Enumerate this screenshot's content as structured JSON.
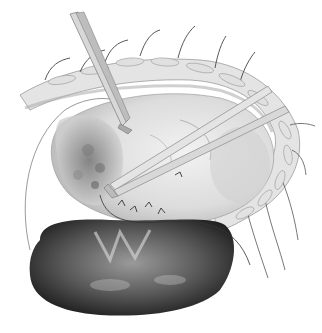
{
  "illustration": {
    "subject": "surgical illustration",
    "style": "grayscale pencil drawing",
    "background": "#ffffff",
    "elements": [
      {
        "name": "incision-cavity",
        "shade": "#d8d8d8"
      },
      {
        "name": "retracted-wound-edge",
        "shade": "#c4c4c4"
      },
      {
        "name": "sutures-top",
        "count": 7
      },
      {
        "name": "sutures-right",
        "count": 5
      },
      {
        "name": "forceps-left",
        "shade": "#bdbdbd"
      },
      {
        "name": "forceps-right",
        "shade": "#cfcfcf"
      },
      {
        "name": "tissue-mass",
        "shade": "#8a8a8a"
      },
      {
        "name": "organ-bottom",
        "shade": "#2a2a2a"
      },
      {
        "name": "suture-thread",
        "shade": "#333333"
      }
    ]
  }
}
